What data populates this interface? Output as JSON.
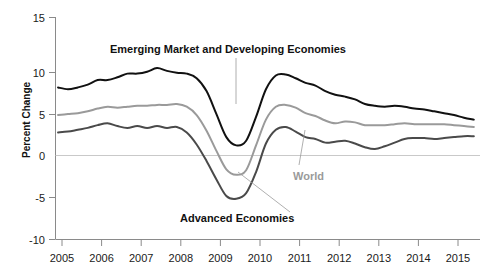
{
  "chart_data": {
    "type": "line",
    "title": "",
    "xlabel": "",
    "ylabel": "Percent Change",
    "ylim": [
      -10,
      15
    ],
    "xlim": [
      2004.75,
      2015.5
    ],
    "yticks": [
      "15",
      "10",
      "5",
      "0",
      "-5",
      "-10"
    ],
    "ytick_values": [
      15,
      10,
      5,
      0,
      -5,
      -10
    ],
    "xticks": [
      "2005",
      "2006",
      "2007",
      "2008",
      "2009",
      "2010",
      "2011",
      "2012",
      "2013",
      "2014",
      "2015"
    ],
    "xtick_values": [
      2005,
      2006,
      2007,
      2008,
      2009,
      2010,
      2011,
      2012,
      2013,
      2014,
      2015
    ],
    "grid": false,
    "zero_line": true,
    "legend_position": "inline-annotations",
    "annotations": [
      {
        "text": "Emerging Market and Developing Economies",
        "color": "#111111"
      },
      {
        "text": "World",
        "color": "#9a9a9a"
      },
      {
        "text": "Advanced Economies",
        "color": "#111111"
      }
    ],
    "series": [
      {
        "name": "Emerging Market and Developing Economies",
        "color": "#111111",
        "width": 2.0,
        "x": [
          2004.9,
          2005.15,
          2005.4,
          2005.65,
          2005.9,
          2006.15,
          2006.4,
          2006.65,
          2006.9,
          2007.15,
          2007.4,
          2007.65,
          2007.9,
          2008.15,
          2008.4,
          2008.65,
          2008.9,
          2009.15,
          2009.4,
          2009.65,
          2009.9,
          2010.15,
          2010.4,
          2010.65,
          2010.9,
          2011.15,
          2011.4,
          2011.65,
          2011.9,
          2012.15,
          2012.4,
          2012.65,
          2012.9,
          2013.15,
          2013.4,
          2013.65,
          2013.9,
          2014.15,
          2014.4,
          2014.65,
          2014.9,
          2015.15,
          2015.4
        ],
        "y": [
          7.4,
          7.2,
          7.4,
          7.7,
          8.2,
          8.2,
          8.5,
          8.9,
          8.9,
          9.1,
          9.5,
          9.2,
          9.0,
          8.9,
          8.4,
          7.0,
          4.5,
          2.0,
          1.1,
          1.6,
          4.2,
          7.2,
          8.7,
          8.8,
          8.4,
          7.9,
          7.6,
          7.0,
          6.6,
          6.4,
          6.1,
          5.6,
          5.4,
          5.3,
          5.4,
          5.3,
          5.1,
          5.0,
          4.8,
          4.6,
          4.4,
          4.1,
          3.9
        ]
      },
      {
        "name": "World",
        "color": "#9a9a9a",
        "width": 2.0,
        "x": [
          2004.9,
          2005.15,
          2005.4,
          2005.65,
          2005.9,
          2006.15,
          2006.4,
          2006.65,
          2006.9,
          2007.15,
          2007.4,
          2007.65,
          2007.9,
          2008.15,
          2008.4,
          2008.65,
          2008.9,
          2009.15,
          2009.4,
          2009.65,
          2009.9,
          2010.15,
          2010.4,
          2010.65,
          2010.9,
          2011.15,
          2011.4,
          2011.65,
          2011.9,
          2012.15,
          2012.4,
          2012.65,
          2012.9,
          2013.15,
          2013.4,
          2013.65,
          2013.9,
          2014.15,
          2014.4,
          2014.65,
          2014.9,
          2015.15,
          2015.4
        ],
        "y": [
          4.4,
          4.5,
          4.6,
          4.8,
          5.1,
          5.3,
          5.2,
          5.3,
          5.4,
          5.4,
          5.5,
          5.5,
          5.6,
          5.3,
          4.4,
          2.7,
          0.5,
          -1.5,
          -2.1,
          -1.6,
          1.1,
          3.9,
          5.3,
          5.5,
          5.2,
          4.6,
          4.3,
          3.8,
          3.5,
          3.7,
          3.6,
          3.3,
          3.3,
          3.3,
          3.4,
          3.5,
          3.4,
          3.4,
          3.4,
          3.4,
          3.3,
          3.2,
          3.1
        ]
      },
      {
        "name": "Advanced Economies",
        "color": "#4a4a4a",
        "width": 2.0,
        "x": [
          2004.9,
          2005.15,
          2005.4,
          2005.65,
          2005.9,
          2006.15,
          2006.4,
          2006.65,
          2006.9,
          2007.15,
          2007.4,
          2007.65,
          2007.9,
          2008.15,
          2008.4,
          2008.65,
          2008.9,
          2009.15,
          2009.4,
          2009.65,
          2009.9,
          2010.15,
          2010.4,
          2010.65,
          2010.9,
          2011.15,
          2011.4,
          2011.65,
          2011.9,
          2012.15,
          2012.4,
          2012.65,
          2012.9,
          2013.15,
          2013.4,
          2013.65,
          2013.9,
          2014.15,
          2014.4,
          2014.65,
          2014.9,
          2015.15,
          2015.4
        ],
        "y": [
          2.5,
          2.6,
          2.8,
          3.0,
          3.3,
          3.5,
          3.2,
          3.0,
          3.2,
          3.0,
          3.2,
          3.0,
          3.1,
          2.5,
          1.2,
          -0.6,
          -2.6,
          -4.4,
          -4.7,
          -4.1,
          -1.8,
          1.3,
          2.8,
          3.1,
          2.6,
          2.0,
          1.8,
          1.4,
          1.5,
          1.6,
          1.3,
          0.9,
          0.7,
          1.0,
          1.4,
          1.8,
          1.9,
          1.9,
          1.8,
          1.9,
          2.0,
          2.1,
          2.1
        ]
      }
    ]
  },
  "axis": {
    "ylabel_text": "Percent Change"
  },
  "labels": {
    "emde": "Emerging Market and Developing Economies",
    "world": "World",
    "advanced": "Advanced Economies"
  },
  "colors": {
    "emde": "#111111",
    "world": "#9a9a9a",
    "advanced": "#4a4a4a",
    "axis": "#8a8a8a",
    "zero_line": "#c9c9c9"
  }
}
